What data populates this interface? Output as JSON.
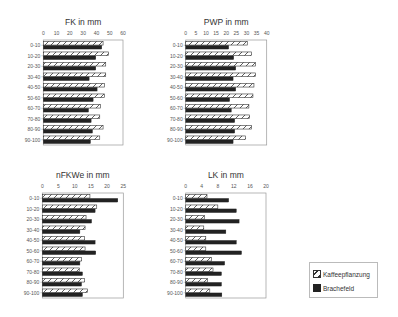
{
  "chart_data": [
    {
      "type": "bar",
      "orientation": "horizontal",
      "title": "FK in mm",
      "categories": [
        "0-10",
        "10-20",
        "20-30",
        "30-40",
        "40-50",
        "50-60",
        "60-70",
        "70-80",
        "80-90",
        "90-100"
      ],
      "xlim": [
        0,
        60
      ],
      "xticks": [
        0,
        10,
        20,
        30,
        40,
        50,
        60
      ],
      "grid": false,
      "series": [
        {
          "name": "Kaffeepflanzung",
          "values": [
            45,
            49,
            47,
            47,
            46,
            46,
            43,
            42.5,
            45,
            42.5
          ]
        },
        {
          "name": "Brachefeld",
          "values": [
            44,
            39.5,
            39.5,
            34.5,
            40.5,
            37.5,
            34,
            36,
            37,
            35.5
          ]
        }
      ]
    },
    {
      "type": "bar",
      "orientation": "horizontal",
      "title": "PWP in mm",
      "categories": [
        "0-10",
        "10-20",
        "20-30",
        "30-40",
        "40-50",
        "50-60",
        "60-70",
        "70-80",
        "80-90",
        "90-100"
      ],
      "xlim": [
        0,
        40
      ],
      "xticks": [
        0,
        5,
        10,
        15,
        20,
        25,
        30,
        35,
        40
      ],
      "grid": false,
      "series": [
        {
          "name": "Kaffeepflanzung",
          "values": [
            30.4,
            32.4,
            34.4,
            34.4,
            33.7,
            33.2,
            31.2,
            31.6,
            32.4,
            29.6
          ]
        },
        {
          "name": "Brachefeld",
          "values": [
            21.2,
            23.7,
            24.7,
            23.4,
            24.7,
            21.7,
            22.5,
            24.2,
            24.2,
            23.4
          ]
        }
      ]
    },
    {
      "type": "bar",
      "orientation": "horizontal",
      "title": "nFKWe in mm",
      "categories": [
        "0-10",
        "10-20",
        "20-30",
        "30-40",
        "40-50",
        "50-60",
        "60-70",
        "70-80",
        "80-90",
        "90-100"
      ],
      "xlim": [
        0,
        25
      ],
      "xticks": [
        0,
        5,
        10,
        15,
        20,
        25
      ],
      "grid": false,
      "series": [
        {
          "name": "Kaffeepflanzung",
          "values": [
            14.7,
            16.8,
            13.5,
            13.2,
            13.0,
            13.2,
            12.1,
            11.4,
            13.0,
            13.9
          ]
        },
        {
          "name": "Brachefeld",
          "values": [
            23.3,
            16.3,
            15.2,
            11.6,
            16.3,
            16.5,
            11.6,
            12.4,
            12.1,
            12.4
          ]
        }
      ]
    },
    {
      "type": "bar",
      "orientation": "horizontal",
      "title": "LK in mm",
      "categories": [
        "0-10",
        "10-20",
        "20-30",
        "30-40",
        "40-50",
        "50-60",
        "60-70",
        "70-80",
        "80-90",
        "90-100"
      ],
      "xlim": [
        0,
        20
      ],
      "xticks": [
        0,
        4,
        8,
        12,
        16,
        20
      ],
      "grid": false,
      "series": [
        {
          "name": "Kaffeepflanzung",
          "values": [
            5.3,
            8.0,
            4.7,
            4.5,
            5.0,
            5.0,
            6.4,
            6.8,
            5.4,
            6.0
          ]
        },
        {
          "name": "Brachefeld",
          "values": [
            10.7,
            12.6,
            13.3,
            10.0,
            12.6,
            13.9,
            9.7,
            8.9,
            8.9,
            9.0
          ]
        }
      ]
    }
  ],
  "legend": {
    "placement": "bottom-right",
    "items": [
      {
        "label": "Kaffeepflanzung",
        "style": "hatched"
      },
      {
        "label": "Brachefeld",
        "style": "solid"
      }
    ]
  },
  "colors": {
    "hatch_stroke": "#333333",
    "solid_fill": "#222222",
    "frame": "#999999",
    "text": "#333333"
  }
}
